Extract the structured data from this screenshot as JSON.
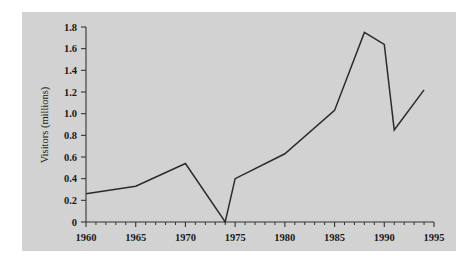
{
  "chart_data": {
    "type": "line",
    "title": "",
    "xlabel": "",
    "ylabel": "Visitors (millions)",
    "xlim": [
      1960,
      1995
    ],
    "ylim": [
      0,
      1.8
    ],
    "grid": false,
    "legend": false,
    "x_ticks": [
      "1960",
      "1965",
      "1970",
      "1975",
      "1980",
      "1985",
      "1990",
      "1995"
    ],
    "x_tick_values": [
      1960,
      1965,
      1970,
      1975,
      1980,
      1985,
      1990,
      1995
    ],
    "x_minor_interval": 1,
    "y_ticks": [
      "0",
      "0.2",
      "0.4",
      "0.6",
      "0.8",
      "1.0",
      "1.2",
      "1.4",
      "1.6",
      "1.8"
    ],
    "y_tick_values": [
      0,
      0.2,
      0.4,
      0.6,
      0.8,
      1.0,
      1.2,
      1.4,
      1.6,
      1.8
    ],
    "series": [
      {
        "name": "Visitors",
        "color": "#2b2b2b",
        "x": [
          1960,
          1965,
          1970,
          1974,
          1975,
          1980,
          1985,
          1988,
          1990,
          1991,
          1994
        ],
        "values": [
          0.26,
          0.33,
          0.54,
          0.0,
          0.4,
          0.63,
          1.03,
          1.75,
          1.64,
          0.85,
          1.22
        ]
      }
    ],
    "annotations": []
  },
  "figure": {
    "background_color": "#ffffff",
    "panel_color": "#d2d2d2",
    "axis_color": "#333333"
  }
}
